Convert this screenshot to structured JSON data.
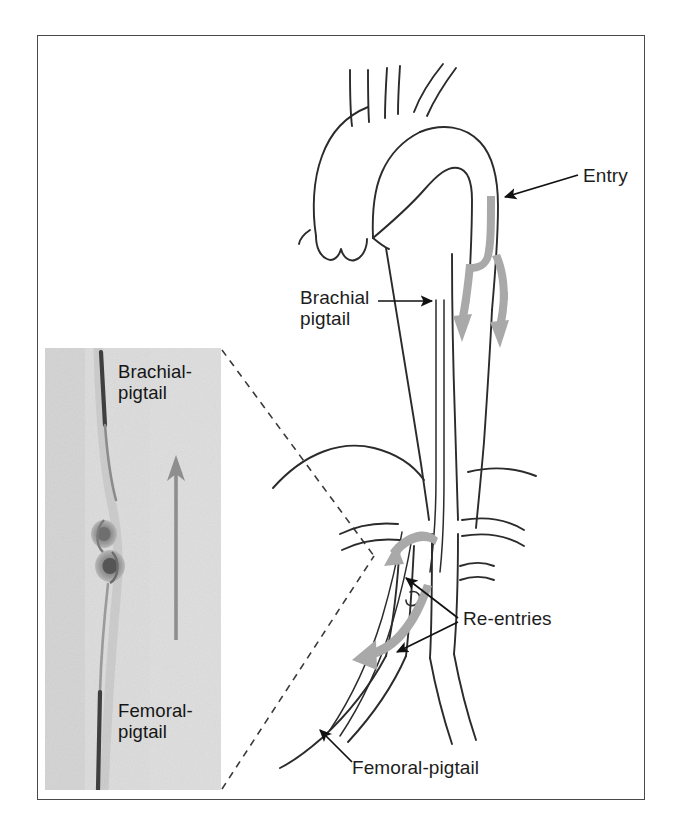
{
  "figure": {
    "domain": "medical-illustration"
  },
  "frame": {
    "border_color": "#4a4a4a",
    "background": "#ffffff"
  },
  "palette": {
    "line": "#2b2b2b",
    "flow_arrow_gray": "#a9a9a9",
    "leader_black": "#111111",
    "inset_background": "#d8d8d8",
    "inset_arrow_gray": "#8e8e8e",
    "catheter_dark": "#3c3c3c",
    "dashed_guide": "#3a3a3a"
  },
  "diagram": {
    "labels": [
      {
        "id": "entry",
        "text": "Entry",
        "lines": [
          "Entry"
        ],
        "points_to": "dissection-entry-tear-descending-aorta"
      },
      {
        "id": "brachial_pigtail",
        "text": "Brachial pigtail",
        "lines": [
          "Brachial",
          "pigtail"
        ],
        "points_to": "brachial-catheter-in-descending-aorta"
      },
      {
        "id": "reentries",
        "text": "Re-entries",
        "lines": [
          "Re-entries"
        ],
        "points_to": "two-reentry-fenestrations-abdominal-aorta"
      },
      {
        "id": "femoral_pigtail",
        "text": "Femoral-pigtail",
        "lines": [
          "Femoral-pigtail"
        ],
        "points_to": "femoral-catheter-in-iliac-artery"
      }
    ],
    "anatomy": [
      "aortic-root-with-valve-cusps",
      "ascending-aorta",
      "aortic-arch",
      "brachiocephalic-trunk",
      "left-common-carotid-artery",
      "left-subclavian-artery",
      "descending-thoracic-aorta",
      "dissection-flap",
      "diaphragm",
      "visceral-branches",
      "renal-arteries",
      "abdominal-aorta",
      "aortic-bifurcation",
      "common-iliac-arteries"
    ],
    "flow_arrows": {
      "count": 4,
      "color": "#a9a9a9",
      "meaning": "blood-flow-true-and-false-lumen"
    }
  },
  "inset": {
    "type": "angiogram-photograph",
    "background": "#d8d8d8",
    "labels": [
      {
        "id": "inset_brachial",
        "text": "Brachial-pigtail",
        "lines": [
          "Brachial-",
          "pigtail"
        ]
      },
      {
        "id": "inset_femoral",
        "text": "Femoral-pigtail",
        "lines": [
          "Femoral-",
          "pigtail"
        ]
      }
    ],
    "features": [
      "interlocked-pigtail-loops",
      "guidewire-track",
      "upward-direction-arrow"
    ],
    "arrow": {
      "direction": "up",
      "color": "#8e8e8e"
    },
    "callout": {
      "style": "dashed",
      "connects_to": "abdominal-aorta-region"
    }
  }
}
